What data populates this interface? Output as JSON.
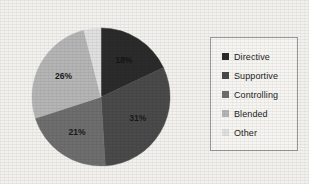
{
  "chart_data": {
    "type": "pie",
    "title": "",
    "categories": [
      "Directive",
      "Supportive",
      "Controlling",
      "Blended",
      "Other"
    ],
    "values": [
      18,
      31,
      21,
      26,
      4
    ],
    "value_labels": [
      "18%",
      "31%",
      "21%",
      "26%",
      "4%"
    ],
    "unit": "%",
    "start_angle_deg": 0,
    "direction": "clockwise",
    "legend_position": "right",
    "grid": false,
    "colors": [
      "#2b2b2b",
      "#4a4a4a",
      "#6e6e6e",
      "#b5b5b5",
      "#e0e0e0"
    ],
    "label_colors": [
      "#151515",
      "#1a1a1a",
      "#1a1a1a",
      "#1a1a1a",
      "#1a1a1a"
    ],
    "label_positions": [
      "inside",
      "inside",
      "inside",
      "inside",
      "outside"
    ]
  },
  "legend": {
    "items": [
      {
        "label": "Directive",
        "color": "#2b2b2b"
      },
      {
        "label": "Supportive",
        "color": "#4a4a4a"
      },
      {
        "label": "Controlling",
        "color": "#6e6e6e"
      },
      {
        "label": "Blended",
        "color": "#b5b5b5"
      },
      {
        "label": "Other",
        "color": "#e0e0e0"
      }
    ]
  }
}
